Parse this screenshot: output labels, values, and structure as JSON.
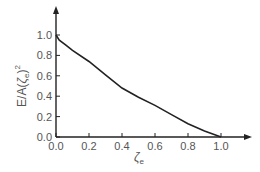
{
  "chart_data": {
    "type": "line",
    "title": "",
    "xlabel": "ζe",
    "ylabel": "E/A(ζe)^2",
    "xlim": [
      0.0,
      1.0
    ],
    "ylim": [
      0.0,
      1.0
    ],
    "xticks": [
      "0.0",
      "0.2",
      "0.4",
      "0.6",
      "0.8",
      "1.0"
    ],
    "yticks": [
      "0.0",
      "0.2",
      "0.4",
      "0.6",
      "0.8",
      "1.0"
    ],
    "grid": false,
    "legend": null,
    "series": [
      {
        "name": "E/A(ζe)^2",
        "x": [
          0.0,
          0.02,
          0.06,
          0.1,
          0.2,
          0.3,
          0.4,
          0.5,
          0.6,
          0.7,
          0.8,
          0.9,
          1.0
        ],
        "y": [
          1.0,
          0.95,
          0.9,
          0.85,
          0.74,
          0.61,
          0.48,
          0.39,
          0.31,
          0.22,
          0.13,
          0.06,
          0.0
        ]
      }
    ],
    "color": "#222222"
  },
  "labels": {
    "ylabel_main": "E/A(",
    "ylabel_zeta": "ζ",
    "ylabel_sub": "e",
    "ylabel_close": ")",
    "ylabel_sup": "2",
    "xlabel_zeta": "ζ",
    "xlabel_sub": "e"
  }
}
